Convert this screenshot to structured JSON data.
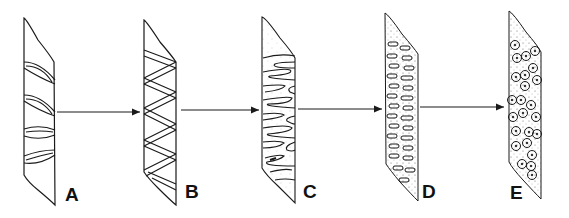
{
  "diagram": {
    "type": "process-sequence",
    "stages": [
      {
        "id": "A",
        "label": "A",
        "pattern": "lens-shaped bands (4)"
      },
      {
        "id": "B",
        "label": "B",
        "pattern": "zig-zag bands"
      },
      {
        "id": "C",
        "label": "C",
        "pattern": "interdigitating folds, lightly stippled"
      },
      {
        "id": "D",
        "label": "D",
        "pattern": "dense elongated loops, stippled"
      },
      {
        "id": "E",
        "label": "E",
        "pattern": "circular dotted nodules, stippled"
      }
    ],
    "arrows": [
      {
        "from": "A",
        "to": "B"
      },
      {
        "from": "B",
        "to": "C"
      },
      {
        "from": "C",
        "to": "D"
      },
      {
        "from": "D",
        "to": "E"
      }
    ],
    "colors": {
      "stroke": "#1a1a1a",
      "background": "#ffffff"
    }
  }
}
